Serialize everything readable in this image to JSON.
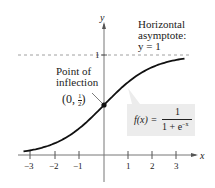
{
  "chart_data": {
    "type": "line",
    "title": "",
    "xlabel": "x",
    "ylabel": "y",
    "function": "f(x) = 1 / (1 + e^-x)",
    "xlim": [
      -3.3,
      3.3
    ],
    "ylim": [
      0,
      1.1
    ],
    "x_ticks": [
      -3,
      -2,
      -1,
      1,
      2,
      3
    ],
    "y_ticks": [
      1
    ],
    "x": [
      -3.3,
      -3,
      -2,
      -1,
      0,
      1,
      2,
      3,
      3.3
    ],
    "series": [
      {
        "name": "f(x)",
        "values": [
          0.036,
          0.047,
          0.119,
          0.269,
          0.5,
          0.731,
          0.881,
          0.953,
          0.964
        ]
      }
    ],
    "asymptote": {
      "y": 1,
      "style": "dashed"
    },
    "inflection_point": {
      "x": 0,
      "y": 0.5
    },
    "grid": false
  },
  "labels": {
    "y_axis": "y",
    "x_axis": "x",
    "asymptote_line1": "Horizontal",
    "asymptote_line2": "asymptote:",
    "asymptote_line3": "y = 1",
    "inflection_line1": "Point of",
    "inflection_line2": "inflection",
    "inflection_coord_open": "(0,",
    "inflection_num": "1",
    "inflection_den": "2",
    "inflection_coord_close": ")",
    "formula_lhs": "f(x) =",
    "formula_num": "1",
    "formula_den": "1 + e",
    "formula_exp": "−x",
    "y_tick_1": "1"
  },
  "x_tick_labels": [
    "−3",
    "−2",
    "−1",
    "1",
    "2",
    "3"
  ]
}
